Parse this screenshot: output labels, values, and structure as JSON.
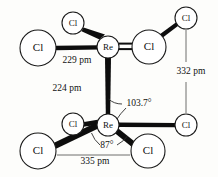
{
  "figure": {
    "type": "chemical-structure-diagram",
    "background_color": "#fdfdfb",
    "line_color": "#0d0d0d",
    "dimension_line_color": "#4a4a4a"
  },
  "atoms": [
    {
      "id": "cl-top-small",
      "label": "Cl",
      "cx": 73,
      "cy": 23,
      "r": 11,
      "size": "small"
    },
    {
      "id": "cl-upper-left",
      "label": "Cl",
      "cx": 38,
      "cy": 48,
      "r": 18,
      "size": "big"
    },
    {
      "id": "re-upper",
      "label": "Re",
      "cx": 108,
      "cy": 47,
      "r": 11,
      "size": "small"
    },
    {
      "id": "cl-upper-right-big",
      "label": "Cl",
      "cx": 149,
      "cy": 47,
      "r": 17,
      "size": "big"
    },
    {
      "id": "cl-top-right",
      "label": "Cl",
      "cx": 186,
      "cy": 18,
      "r": 11,
      "size": "small"
    },
    {
      "id": "cl-mid-right",
      "label": "Cl",
      "cx": 186,
      "cy": 125,
      "r": 11,
      "size": "small"
    },
    {
      "id": "re-lower",
      "label": "Re",
      "cx": 108,
      "cy": 125,
      "r": 11,
      "size": "small"
    },
    {
      "id": "cl-lower-small",
      "label": "Cl",
      "cx": 73,
      "cy": 124,
      "r": 11,
      "size": "small"
    },
    {
      "id": "cl-bottom-left",
      "label": "Cl",
      "cx": 38,
      "cy": 151,
      "r": 18,
      "size": "big"
    },
    {
      "id": "cl-bottom-right",
      "label": "Cl",
      "cx": 148,
      "cy": 151,
      "r": 17,
      "size": "big"
    }
  ],
  "measurements": {
    "re_cl_upper": {
      "value": "229 pm",
      "x": 77,
      "y": 61
    },
    "re_re_bond": {
      "value": "224 pm",
      "x": 67,
      "y": 89
    },
    "cl_cl_right": {
      "value": "332 pm",
      "x": 191,
      "y": 72
    },
    "cl_cl_bottom": {
      "value": "335 pm",
      "x": 95,
      "y": 160
    },
    "angle_re_re_cl": {
      "value": "103.7°",
      "x": 139,
      "y": 104
    },
    "angle_cl_re_cl": {
      "value": "87°",
      "x": 107,
      "y": 146
    }
  },
  "bonds": [
    {
      "id": "bond-re-upper-cl-top-small",
      "from": "re-upper",
      "to": "cl-top-small",
      "style": "thick"
    },
    {
      "id": "bond-re-upper-cl-left",
      "from": "re-upper",
      "to": "cl-upper-left",
      "style": "thick"
    },
    {
      "id": "bond-re-upper-cl-right-big",
      "from": "re-upper",
      "to": "cl-upper-right-big",
      "style": "double"
    },
    {
      "id": "bond-cl-right-big-cl-corner",
      "from": "cl-upper-right-big",
      "to": "cl-top-right",
      "style": "thick"
    },
    {
      "id": "bond-re-re",
      "from": "re-upper",
      "to": "re-lower",
      "style": "thick"
    },
    {
      "id": "bond-re-lower-cl-small",
      "from": "re-lower",
      "to": "cl-lower-small",
      "style": "thick"
    },
    {
      "id": "bond-re-lower-cl-bottom-left",
      "from": "re-lower",
      "to": "cl-bottom-left",
      "style": "thick"
    },
    {
      "id": "bond-re-lower-cl-bottom-right",
      "from": "re-lower",
      "to": "cl-bottom-right",
      "style": "thick"
    },
    {
      "id": "bond-re-lower-cl-mid-right",
      "from": "re-lower",
      "to": "cl-mid-right",
      "style": "thick"
    }
  ]
}
